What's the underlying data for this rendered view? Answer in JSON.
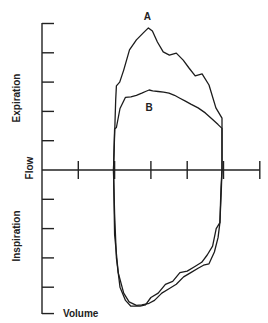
{
  "chart_data": {
    "type": "line",
    "title": "",
    "xlabel": "Volume",
    "ylabel": "Flow",
    "ylabel_positive": "Expiration",
    "ylabel_negative": "Inspiration",
    "x_ticks": [
      0,
      1,
      2,
      3,
      4,
      5,
      6
    ],
    "y_ticks": [
      -4,
      -3,
      -2,
      -1,
      0,
      1,
      2,
      3,
      4,
      5
    ],
    "xlim": [
      0,
      6
    ],
    "ylim": [
      -4.9,
      5
    ],
    "grid": false,
    "series": [
      {
        "name": "A",
        "label_at": [
          2.9,
          5.25
        ],
        "points": [
          [
            1.97,
            0
          ],
          [
            2.03,
            2.4
          ],
          [
            2.05,
            2.87
          ],
          [
            2.14,
            3.0
          ],
          [
            2.25,
            3.41
          ],
          [
            2.41,
            4.1
          ],
          [
            2.6,
            4.44
          ],
          [
            2.79,
            4.68
          ],
          [
            2.93,
            4.85
          ],
          [
            3.04,
            4.74
          ],
          [
            3.18,
            4.37
          ],
          [
            3.34,
            4.03
          ],
          [
            3.51,
            3.92
          ],
          [
            3.7,
            3.99
          ],
          [
            3.89,
            3.75
          ],
          [
            4.05,
            3.48
          ],
          [
            4.22,
            3.21
          ],
          [
            4.41,
            3.28
          ],
          [
            4.6,
            2.9
          ],
          [
            4.79,
            2.12
          ],
          [
            4.96,
            1.77
          ],
          [
            4.96,
            0
          ],
          [
            4.93,
            -0.6
          ],
          [
            4.9,
            -1.8
          ],
          [
            4.8,
            -2.0
          ],
          [
            4.7,
            -2.6
          ],
          [
            4.55,
            -2.9
          ],
          [
            4.4,
            -3.15
          ],
          [
            4.2,
            -3.3
          ],
          [
            4.0,
            -3.45
          ],
          [
            3.8,
            -3.5
          ],
          [
            3.6,
            -3.8
          ],
          [
            3.4,
            -3.9
          ],
          [
            3.2,
            -4.2
          ],
          [
            3.0,
            -4.35
          ],
          [
            2.85,
            -4.6
          ],
          [
            2.7,
            -4.65
          ],
          [
            2.45,
            -4.65
          ],
          [
            2.3,
            -4.45
          ],
          [
            2.15,
            -4.0
          ],
          [
            2.05,
            -3.0
          ],
          [
            2.0,
            -1.5
          ],
          [
            1.97,
            0
          ]
        ]
      },
      {
        "name": "B",
        "label_at": [
          2.95,
          2.15
        ],
        "points": [
          [
            1.97,
            0
          ],
          [
            2.0,
            1.4
          ],
          [
            2.05,
            1.45
          ],
          [
            2.15,
            2.1
          ],
          [
            2.3,
            2.48
          ],
          [
            2.45,
            2.5
          ],
          [
            2.6,
            2.55
          ],
          [
            2.75,
            2.62
          ],
          [
            2.85,
            2.68
          ],
          [
            2.95,
            2.73
          ],
          [
            3.05,
            2.7
          ],
          [
            3.2,
            2.68
          ],
          [
            3.35,
            2.66
          ],
          [
            3.5,
            2.62
          ],
          [
            3.65,
            2.55
          ],
          [
            3.8,
            2.45
          ],
          [
            3.95,
            2.35
          ],
          [
            4.1,
            2.25
          ],
          [
            4.3,
            2.12
          ],
          [
            4.5,
            1.95
          ],
          [
            4.7,
            1.72
          ],
          [
            4.85,
            1.55
          ],
          [
            4.96,
            1.42
          ],
          [
            4.96,
            0
          ],
          [
            4.94,
            -0.7
          ],
          [
            4.9,
            -1.8
          ],
          [
            4.85,
            -2.3
          ],
          [
            4.75,
            -2.8
          ],
          [
            4.6,
            -3.2
          ],
          [
            4.45,
            -3.25
          ],
          [
            4.3,
            -3.35
          ],
          [
            4.1,
            -3.5
          ],
          [
            3.9,
            -3.65
          ],
          [
            3.7,
            -3.9
          ],
          [
            3.5,
            -4.05
          ],
          [
            3.3,
            -4.2
          ],
          [
            3.1,
            -4.45
          ],
          [
            2.95,
            -4.55
          ],
          [
            2.75,
            -4.6
          ],
          [
            2.6,
            -4.62
          ],
          [
            2.4,
            -4.5
          ],
          [
            2.25,
            -4.2
          ],
          [
            2.1,
            -3.5
          ],
          [
            2.0,
            -2.2
          ],
          [
            1.97,
            0
          ]
        ]
      }
    ]
  }
}
